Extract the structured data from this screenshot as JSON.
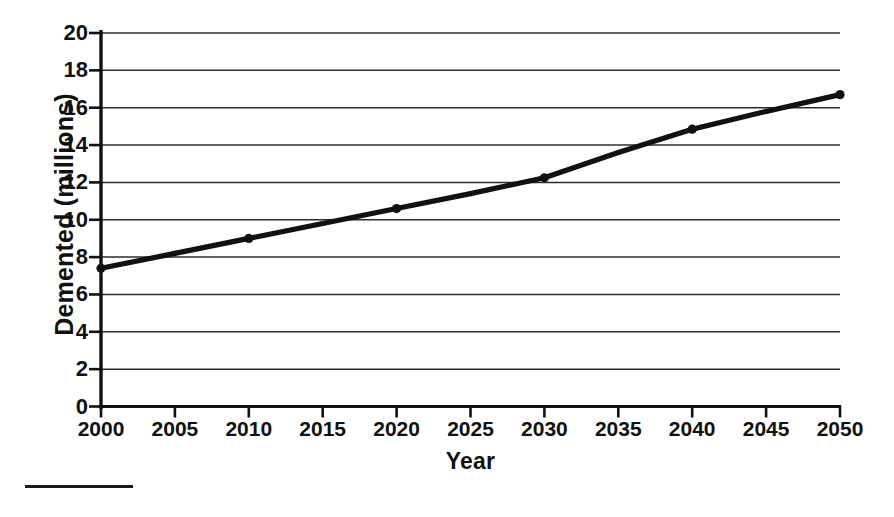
{
  "chart_data": {
    "type": "line",
    "title": "",
    "subtitle": "",
    "xlabel": "Year",
    "ylabel": "Demented (millions)",
    "xlim": [
      2000,
      2050
    ],
    "ylim": [
      0,
      20
    ],
    "grid": true,
    "grid_axis": "y",
    "legend": "none",
    "x_tick_labels": [
      "2000",
      "2005",
      "2010",
      "2015",
      "2020",
      "2025",
      "2030",
      "2035",
      "2040",
      "2045",
      "2050"
    ],
    "x_ticks": [
      2000,
      2005,
      2010,
      2015,
      2020,
      2025,
      2030,
      2035,
      2040,
      2045,
      2050
    ],
    "y_tick_labels": [
      "0",
      "2",
      "4",
      "6",
      "8",
      "10",
      "12",
      "14",
      "16",
      "18",
      "20"
    ],
    "y_ticks": [
      0,
      2,
      4,
      6,
      8,
      10,
      12,
      14,
      16,
      18,
      20
    ],
    "x": [
      2000,
      2005,
      2010,
      2015,
      2020,
      2025,
      2030,
      2035,
      2040,
      2045,
      2050
    ],
    "values": [
      7.4,
      8.2,
      9.0,
      9.8,
      10.6,
      11.4,
      12.25,
      13.6,
      14.85,
      15.8,
      16.7
    ],
    "series": [
      {
        "name": "Demented population",
        "values": [
          7.4,
          8.2,
          9.0,
          9.8,
          10.6,
          11.4,
          12.25,
          13.6,
          14.85,
          15.8,
          16.7
        ]
      }
    ],
    "marker": "circle",
    "line_color": "#111111",
    "grid_color": "#2b2b2b",
    "background_color": "#ffffff",
    "annotations": []
  },
  "axes": {
    "y_title": "Demented (millions)",
    "x_title": "Year"
  },
  "footer": {
    "rule_visible": true
  }
}
